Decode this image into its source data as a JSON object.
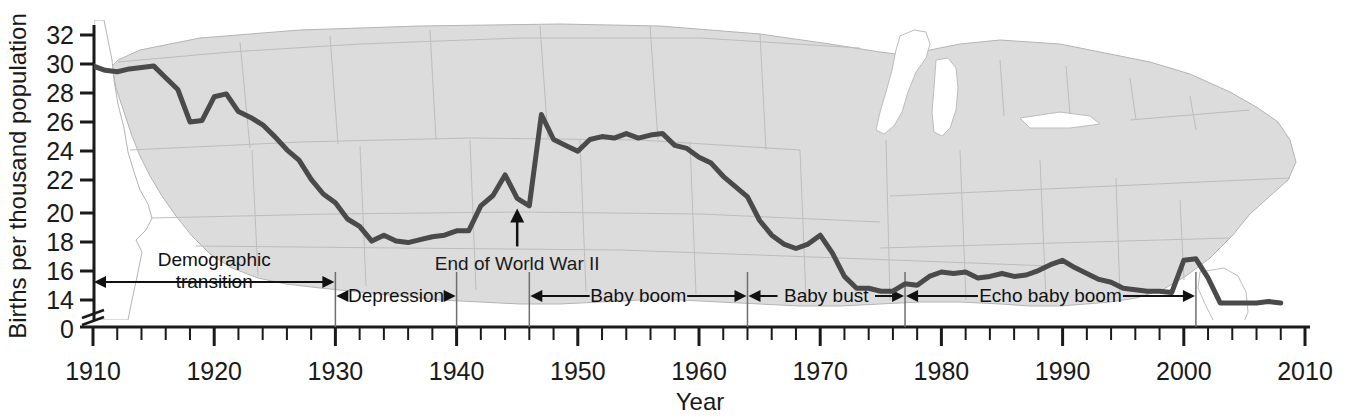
{
  "chart_data": {
    "type": "line",
    "title": "",
    "xlabel": "Year",
    "ylabel": "Births per thousand population",
    "xlim": [
      1910,
      2010
    ],
    "ylim": [
      13,
      32
    ],
    "y_axis_break": true,
    "y_zero_label": "0",
    "grid": false,
    "legend": "none",
    "xticks": [
      1910,
      1920,
      1930,
      1940,
      1950,
      1960,
      1970,
      1980,
      1990,
      2000,
      2010
    ],
    "xtick_labels": [
      "1910",
      "1920",
      "1930",
      "1940",
      "1950",
      "1960",
      "1970",
      "1980",
      "1990",
      "2000",
      "2010"
    ],
    "x_minor_tick_interval": 2,
    "yticks": [
      0,
      14,
      16,
      18,
      20,
      22,
      24,
      26,
      28,
      30,
      32
    ],
    "ytick_labels": [
      "0",
      "14",
      "16",
      "18",
      "20",
      "22",
      "24",
      "26",
      "28",
      "30",
      "32"
    ],
    "line_color": "#4a4a4a",
    "line_width": 5,
    "series": [
      {
        "name": "U.S. birth rate",
        "x": [
          1910,
          1911,
          1912,
          1913,
          1914,
          1915,
          1916,
          1917,
          1918,
          1919,
          1920,
          1921,
          1922,
          1923,
          1924,
          1925,
          1926,
          1927,
          1928,
          1929,
          1930,
          1931,
          1932,
          1933,
          1934,
          1935,
          1936,
          1937,
          1938,
          1939,
          1940,
          1941,
          1942,
          1943,
          1944,
          1945,
          1946,
          1947,
          1948,
          1949,
          1950,
          1951,
          1952,
          1953,
          1954,
          1955,
          1956,
          1957,
          1958,
          1959,
          1960,
          1961,
          1962,
          1963,
          1964,
          1965,
          1966,
          1967,
          1968,
          1969,
          1970,
          1971,
          1972,
          1973,
          1974,
          1975,
          1976,
          1977,
          1978,
          1979,
          1980,
          1981,
          1982,
          1983,
          1984,
          1985,
          1986,
          1987,
          1988,
          1989,
          1990,
          1991,
          1992,
          1993,
          1994,
          1995,
          1996,
          1997,
          1998,
          1999,
          2000,
          2001,
          2002,
          2003,
          2004,
          2005,
          2006,
          2007,
          2008
        ],
        "y": [
          29.9,
          29.6,
          29.5,
          29.7,
          29.8,
          29.9,
          29.1,
          28.3,
          26.1,
          26.2,
          27.8,
          28.0,
          26.8,
          26.4,
          25.9,
          25.1,
          24.2,
          23.5,
          22.2,
          21.2,
          20.6,
          19.5,
          19.0,
          18.0,
          18.4,
          18.0,
          17.9,
          18.1,
          18.3,
          18.4,
          18.7,
          18.7,
          20.4,
          21.1,
          22.5,
          20.9,
          20.4,
          26.6,
          24.9,
          24.5,
          24.1,
          24.9,
          25.1,
          25.0,
          25.3,
          25.0,
          25.2,
          25.3,
          24.5,
          24.3,
          23.7,
          23.3,
          22.4,
          21.7,
          21.0,
          19.4,
          18.4,
          17.8,
          17.5,
          17.8,
          18.4,
          17.2,
          15.6,
          14.8,
          14.8,
          14.6,
          14.6,
          15.1,
          15.0,
          15.6,
          15.9,
          15.8,
          15.9,
          15.5,
          15.6,
          15.8,
          15.6,
          15.7,
          16.0,
          16.4,
          16.7,
          16.2,
          15.8,
          15.4,
          15.2,
          14.8,
          14.7,
          14.6,
          14.6,
          14.5,
          16.7,
          16.8,
          15.5,
          13.8,
          13.8,
          13.8,
          13.8,
          13.9,
          13.8
        ]
      }
    ],
    "annotations": [
      {
        "name": "end-of-wwii",
        "text": "End of World War II",
        "x": 1945,
        "y": 20.9,
        "arrow": true
      }
    ],
    "period_brackets": [
      {
        "name": "demographic-transition",
        "label": "Demographic\ntransition",
        "label_line1": "Demographic",
        "label_line2": "transition",
        "start": 1910,
        "end": 1930
      },
      {
        "name": "depression",
        "label": "Depression",
        "start": 1930,
        "end": 1940
      },
      {
        "name": "baby-boom",
        "label": "Baby boom",
        "start": 1946,
        "end": 1964
      },
      {
        "name": "baby-bust",
        "label": "Baby bust",
        "start": 1964,
        "end": 1977
      },
      {
        "name": "echo-baby-boom",
        "label": "Echo baby boom",
        "start": 1977,
        "end": 2001
      }
    ],
    "background": {
      "type": "us-map-silhouette",
      "fill": "#dcdcdc",
      "border": "#b0b0b0"
    }
  }
}
